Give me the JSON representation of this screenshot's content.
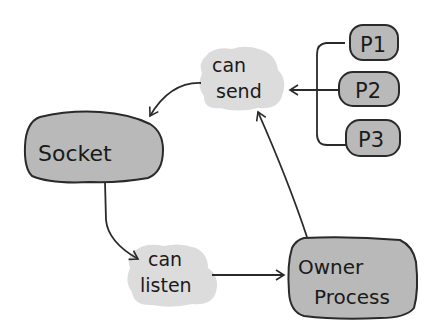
{
  "diagram": {
    "nodes": {
      "socket": {
        "label": "Socket",
        "shape": "rounded-blob",
        "fill": "#b9b9b9"
      },
      "can_send": {
        "line1": "can",
        "line2": "send",
        "shape": "cloud",
        "fill": "#dcdcdc"
      },
      "can_listen": {
        "line1": "can",
        "line2": "listen",
        "shape": "cloud",
        "fill": "#dcdcdc"
      },
      "owner_process": {
        "line1": "Owner",
        "line2": "Process",
        "shape": "rounded-blob",
        "fill": "#b9b9b9"
      },
      "p1": {
        "label": "P1",
        "fill": "#b9b9b9"
      },
      "p2": {
        "label": "P2",
        "fill": "#b9b9b9"
      },
      "p3": {
        "label": "P3",
        "fill": "#b9b9b9"
      }
    },
    "edges": [
      {
        "from": "can_send",
        "to": "socket"
      },
      {
        "from": "socket",
        "to": "can_listen"
      },
      {
        "from": "can_listen",
        "to": "owner_process"
      },
      {
        "from": "owner_process",
        "to": "can_send"
      },
      {
        "from": [
          "p1",
          "p2",
          "p3"
        ],
        "to": "can_send",
        "style": "bracket"
      }
    ],
    "colors": {
      "stroke": "#2a2a2a",
      "box_fill": "#b9b9b9",
      "cloud_fill": "#dcdcdc"
    }
  }
}
